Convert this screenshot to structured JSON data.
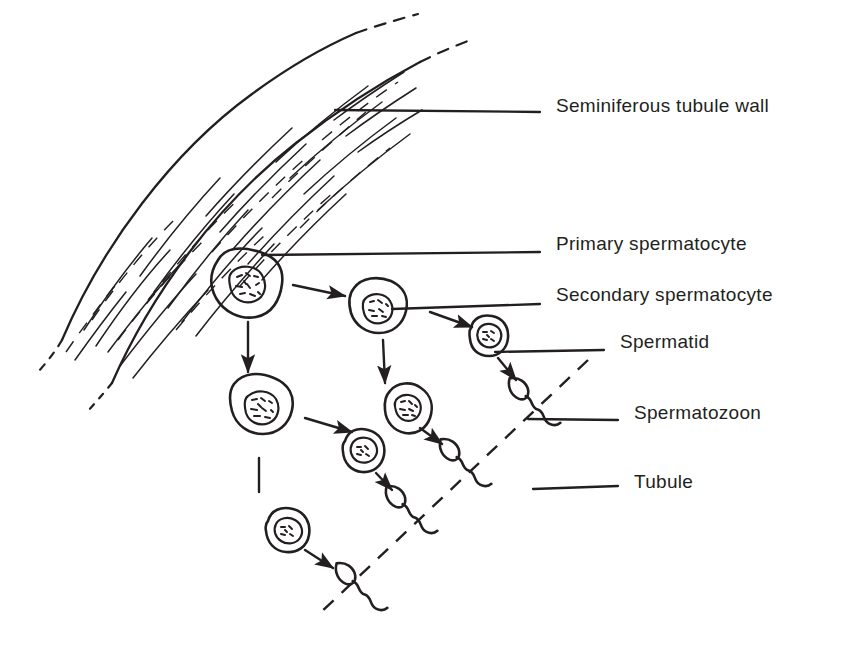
{
  "figure": {
    "background_color": "#ffffff",
    "ink_color": "#231f20",
    "width": 842,
    "height": 660
  },
  "labels": [
    {
      "id": "seminiferous-tubule-wall",
      "text": "Seminiferous tubule wall",
      "x": 556,
      "y": 105,
      "leader": {
        "x1": 335,
        "y1": 110,
        "x2": 540,
        "y2": 112
      }
    },
    {
      "id": "primary-spermatocyte",
      "text": "Primary spermatocyte",
      "x": 556,
      "y": 243,
      "leader": {
        "x1": 262,
        "y1": 255,
        "x2": 540,
        "y2": 252
      }
    },
    {
      "id": "secondary-spermatocyte",
      "text": "Secondary spermatocyte",
      "x": 556,
      "y": 294,
      "leader": {
        "x1": 392,
        "y1": 309,
        "x2": 540,
        "y2": 304
      }
    },
    {
      "id": "spermatid",
      "text": "Spermatid",
      "x": 620,
      "y": 341,
      "leader": {
        "x1": 495,
        "y1": 352,
        "x2": 604,
        "y2": 350
      }
    },
    {
      "id": "spermatozoon",
      "text": "Spermatozoon",
      "x": 634,
      "y": 412,
      "leader": {
        "x1": 528,
        "y1": 419,
        "x2": 618,
        "y2": 420
      }
    },
    {
      "id": "tubule",
      "text": "Tubule",
      "x": 634,
      "y": 481,
      "leader": {
        "x1": 533,
        "y1": 489,
        "x2": 618,
        "y2": 486
      }
    }
  ],
  "structures": {
    "tubule_wall": {
      "name": "seminiferous tubule wall",
      "description": "curved fibrous band, hatched, dashed at both ends"
    },
    "lumen_boundary": {
      "name": "tubule lumen boundary",
      "style": "dashed diagonal",
      "x1": 588,
      "y1": 360,
      "x2": 316,
      "y2": 617
    }
  },
  "cells": [
    {
      "id": "primary-1",
      "type": "primary spermatocyte",
      "cx": 248,
      "cy": 284,
      "rx": 34,
      "ry": 31,
      "nucleus_r": 17
    },
    {
      "id": "primary-2",
      "type": "primary spermatocyte",
      "cx": 262,
      "cy": 404,
      "rx": 31,
      "ry": 29,
      "nucleus_r": 16
    },
    {
      "id": "secondary-1",
      "type": "secondary spermatocyte",
      "cx": 379,
      "cy": 307,
      "rx": 29,
      "ry": 27,
      "nucleus_r": 15
    },
    {
      "id": "secondary-2",
      "type": "secondary spermatocyte",
      "cx": 408,
      "cy": 407,
      "rx": 24,
      "ry": 26,
      "nucleus_r": 14
    },
    {
      "id": "spermatid-1",
      "type": "spermatid",
      "cx": 489,
      "cy": 337,
      "rx": 19,
      "ry": 19,
      "nucleus_r": 11
    },
    {
      "id": "spermatid-2",
      "type": "spermatid",
      "cx": 363,
      "cy": 451,
      "rx": 20,
      "ry": 20,
      "nucleus_r": 11
    },
    {
      "id": "spermatid-3",
      "type": "spermatid",
      "cx": 288,
      "cy": 531,
      "rx": 21,
      "ry": 20,
      "nucleus_r": 11
    }
  ],
  "spermatozoa": [
    {
      "id": "sperm-1",
      "head_x": 521,
      "head_y": 391,
      "angle": -42
    },
    {
      "id": "sperm-2",
      "head_x": 452,
      "head_y": 452,
      "angle": -42
    },
    {
      "id": "sperm-3",
      "head_x": 398,
      "head_y": 499,
      "angle": -42
    },
    {
      "id": "sperm-4",
      "head_x": 348,
      "head_y": 576,
      "angle": -42
    }
  ],
  "arrows": [
    {
      "id": "arrow-primary1-to-secondary1",
      "x1": 293,
      "y1": 285,
      "x2": 345,
      "y2": 296,
      "head": true
    },
    {
      "id": "arrow-primary1-down",
      "x1": 248,
      "y1": 322,
      "x2": 248,
      "y2": 372,
      "head": true
    },
    {
      "id": "arrow-secondary1-to-spermatid1",
      "x1": 430,
      "y1": 312,
      "x2": 472,
      "y2": 327,
      "head": true
    },
    {
      "id": "arrow-secondary1-down",
      "x1": 383,
      "y1": 340,
      "x2": 385,
      "y2": 383,
      "head": true
    },
    {
      "id": "arrow-spermatid1-to-sperm1",
      "x1": 498,
      "y1": 358,
      "x2": 516,
      "y2": 380,
      "head": true
    },
    {
      "id": "arrow-primary2-to-secondary2",
      "x1": 305,
      "y1": 418,
      "x2": 352,
      "y2": 432,
      "head": true
    },
    {
      "id": "arrow-secondary2-to-sperm2",
      "x1": 420,
      "y1": 428,
      "x2": 442,
      "y2": 444,
      "head": true
    },
    {
      "id": "arrow-spermatid2-to-sperm3",
      "x1": 376,
      "y1": 473,
      "x2": 392,
      "y2": 490,
      "head": true
    },
    {
      "id": "arrow-primary2-down",
      "x1": 259,
      "y1": 458,
      "x2": 259,
      "y2": 490,
      "head": false
    },
    {
      "id": "arrow-spermatid3-to-sperm4",
      "x1": 305,
      "y1": 550,
      "x2": 333,
      "y2": 568,
      "head": true
    }
  ]
}
